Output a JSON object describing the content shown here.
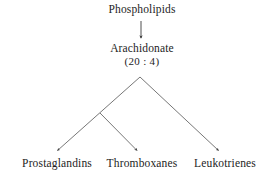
{
  "diagram": {
    "background_color": "#ffffff",
    "line_color": "#3a3a3a",
    "text_color": "#1d1d1d",
    "nodes": {
      "source": {
        "label": "Phospholipids",
        "x": 142,
        "y": 4
      },
      "intermediate": {
        "label": "Arachidonate",
        "detail": "(20 : 4)",
        "x": 142,
        "y": 43
      },
      "products": [
        {
          "label": "Prostaglandins",
          "x": 57,
          "y": 158
        },
        {
          "label": "Thromboxanes",
          "x": 142,
          "y": 158
        },
        {
          "label": "Leukotrienes",
          "x": 225,
          "y": 158
        }
      ]
    },
    "edges": [
      {
        "name": "phospholipids-to-arachidonate",
        "from": "Phospholipids",
        "to": "Arachidonate",
        "path": "M 141 21 L 141 38"
      },
      {
        "name": "arachidonate-to-prostaglandins",
        "from": "Arachidonate",
        "to": "Prostaglandins",
        "path": "M 140 77 L 57.5 150.5"
      },
      {
        "name": "branch-to-thromboxanes",
        "from": "Arachidonate",
        "to": "Thromboxanes",
        "path": "M 100 113 L 137 150.5"
      },
      {
        "name": "arachidonate-to-leukotrienes",
        "from": "Arachidonate",
        "to": "Leukotrienes",
        "path": "M 140 77 L 218.5 150.5"
      }
    ]
  }
}
